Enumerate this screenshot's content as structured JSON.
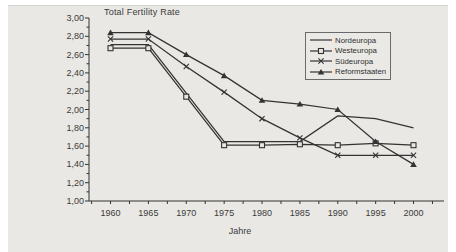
{
  "page": {
    "background_color": "#ffffff",
    "scan_background_color": "#e9e8e4",
    "line_color": "#333333",
    "text_color": "#3b3b3b"
  },
  "chart": {
    "title": "Total Fertility Rate",
    "xlabel": "Jahre",
    "legend": [
      {
        "label": "Nordeuropa",
        "marker": "none"
      },
      {
        "label": "Westeuropa",
        "marker": "square"
      },
      {
        "label": "Südeuropa",
        "marker": "x"
      },
      {
        "label": "Reformstaaten",
        "marker": "triangle"
      }
    ]
  },
  "chart_data": {
    "type": "line",
    "title": "Total Fertility Rate",
    "xlabel": "Jahre",
    "ylabel": "",
    "categories": [
      "1960",
      "1965",
      "1970",
      "1975",
      "1980",
      "1985",
      "1990",
      "1995",
      "2000"
    ],
    "series": [
      {
        "name": "Nordeuropa",
        "marker": "none",
        "values": [
          2.71,
          2.71,
          2.18,
          1.65,
          1.65,
          1.65,
          1.93,
          1.9,
          1.8
        ]
      },
      {
        "name": "Westeuropa",
        "marker": "square",
        "values": [
          2.67,
          2.67,
          2.14,
          1.61,
          1.61,
          1.62,
          1.61,
          1.63,
          1.61
        ]
      },
      {
        "name": "Südeuropa",
        "marker": "x",
        "values": [
          2.77,
          2.77,
          2.47,
          2.19,
          1.9,
          1.69,
          1.5,
          1.5,
          1.5
        ]
      },
      {
        "name": "Reformstaaten",
        "marker": "triangle",
        "values": [
          2.84,
          2.84,
          2.6,
          2.37,
          2.1,
          2.06,
          2.0,
          1.65,
          1.4
        ]
      }
    ],
    "ylim": [
      1.0,
      3.0
    ],
    "ytick_major_step": 0.2,
    "ytick_minor_step": 0.1,
    "ytick_labels": [
      "3,00",
      "2,80",
      "2,60",
      "2,40",
      "2,20",
      "2,00",
      "1,80",
      "1,60",
      "1,40",
      "1,20",
      "1,00"
    ],
    "grid": false,
    "legend_position": "upper-right"
  }
}
